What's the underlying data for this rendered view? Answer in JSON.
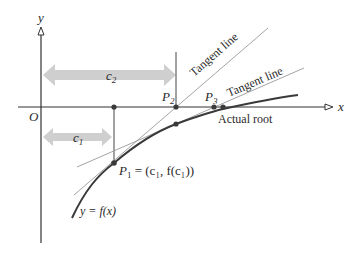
{
  "diagram": {
    "axes": {
      "x_label": "x",
      "y_label": "y",
      "origin_label": "O"
    },
    "intervals": [
      {
        "id": "c1",
        "label": "c",
        "subscript": "1"
      },
      {
        "id": "c2",
        "label": "c",
        "subscript": "2"
      }
    ],
    "points": {
      "p1": {
        "label": "P",
        "subscript": "1",
        "equation": " = (c₁, f(c₁))"
      },
      "p2": {
        "label": "P",
        "subscript": "2"
      },
      "p3": {
        "label": "P",
        "subscript": "3"
      }
    },
    "annotations": {
      "tangent_line_1": "Tangent line",
      "tangent_line_2": "Tangent line",
      "actual_root": "Actual root",
      "curve_label": "y = f(x)"
    },
    "colors": {
      "axis": "#333333",
      "curve": "#3a3a3a",
      "tangent": "#9a9a9a",
      "interval_arrow": "#cfcfcf",
      "point": "#3a3a3a"
    }
  }
}
